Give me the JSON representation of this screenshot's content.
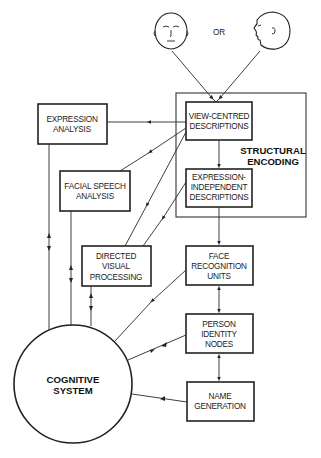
{
  "diagram": {
    "inputs": {
      "left_face": "front-face-icon",
      "connector": "OR",
      "right_face": "profile-face-icon"
    },
    "structural_encoding": {
      "title_line1": "STRUCTURAL",
      "title_line2": "ENCODING",
      "view_centred": [
        "VIEW-CENTRED",
        "DESCRIPTIONS"
      ],
      "expression_independent": [
        "EXPRESSION-",
        "INDEPENDENT",
        "DESCRIPTIONS"
      ]
    },
    "expression_analysis": [
      "EXPRESSION",
      "ANALYSIS"
    ],
    "facial_speech_analysis": [
      "FACIAL SPEECH",
      "ANALYSIS"
    ],
    "directed_visual_processing": [
      "DIRECTED",
      "VISUAL",
      "PROCESSING"
    ],
    "face_recognition_units": [
      "FACE",
      "RECOGNITION",
      "UNITS"
    ],
    "person_identity_nodes": [
      "PERSON",
      "IDENTITY",
      "NODES"
    ],
    "name_generation": [
      "NAME",
      "GENERATION"
    ],
    "cognitive_system": [
      "COGNITIVE",
      "SYSTEM"
    ],
    "edges": [
      {
        "from": "front-face",
        "to": "view-centred-descriptions"
      },
      {
        "from": "profile-face",
        "to": "view-centred-descriptions"
      },
      {
        "from": "view-centred-descriptions",
        "to": "expression-analysis"
      },
      {
        "from": "view-centred-descriptions",
        "to": "facial-speech-analysis"
      },
      {
        "from": "view-centred-descriptions",
        "to": "directed-visual-processing"
      },
      {
        "from": "view-centred-descriptions",
        "to": "expression-independent-descriptions"
      },
      {
        "from": "expression-independent-descriptions",
        "to": "directed-visual-processing"
      },
      {
        "from": "expression-independent-descriptions",
        "to": "face-recognition-units"
      },
      {
        "from": "face-recognition-units",
        "to": "person-identity-nodes",
        "bidirectional": true
      },
      {
        "from": "person-identity-nodes",
        "to": "name-generation",
        "bidirectional": true
      },
      {
        "from": "expression-analysis",
        "to": "cognitive-system",
        "bidirectional": true
      },
      {
        "from": "facial-speech-analysis",
        "to": "cognitive-system",
        "bidirectional": true
      },
      {
        "from": "directed-visual-processing",
        "to": "cognitive-system",
        "bidirectional": true
      },
      {
        "from": "face-recognition-units",
        "to": "cognitive-system"
      },
      {
        "from": "person-identity-nodes",
        "to": "cognitive-system",
        "bidirectional": true
      },
      {
        "from": "name-generation",
        "to": "cognitive-system"
      }
    ]
  }
}
